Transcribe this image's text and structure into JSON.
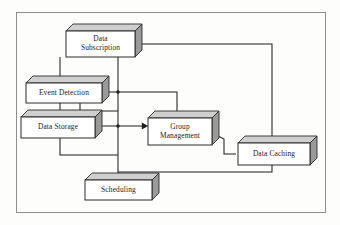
{
  "diagram": {
    "frame": {
      "x": 16,
      "y": 12,
      "width": 309,
      "height": 200,
      "border_color": "#8d8d8d",
      "background_color": "#fdfdfc"
    },
    "style": {
      "node_face_color": "#ffffff",
      "node_side_color": "#9a9a9a",
      "node_top_color": "#cfcfcf",
      "node_border_color": "#2b2b2b",
      "connector_color": "#1f1f1f",
      "text_color": "#1a1a1a"
    },
    "nodes": [
      {
        "id": "data-subscription",
        "label": "Data Subscription",
        "lines": [
          "Data",
          "Subscription"
        ],
        "x": 66,
        "y": 31,
        "width": 69,
        "height": 26,
        "depth": 7
      },
      {
        "id": "event-detection",
        "label": "Event Detection",
        "lines": [
          "Event Detection"
        ],
        "x": 26,
        "y": 83,
        "width": 76,
        "height": 20,
        "depth": 7
      },
      {
        "id": "data-storage",
        "label": "Data Storage",
        "lines": [
          "Data Storage"
        ],
        "x": 21,
        "y": 117,
        "width": 74,
        "height": 21,
        "depth": 7
      },
      {
        "id": "group-management",
        "label": "Group Management",
        "lines": [
          "Group",
          "Management"
        ],
        "x": 148,
        "y": 118,
        "width": 64,
        "height": 27,
        "depth": 7
      },
      {
        "id": "data-caching",
        "label": "Data Caching",
        "lines": [
          "Data Caching"
        ],
        "x": 238,
        "y": 143,
        "width": 72,
        "height": 22,
        "depth": 7
      },
      {
        "id": "scheduling",
        "label": "Scheduling",
        "lines": [
          "Scheduling"
        ],
        "x": 85,
        "y": 180,
        "width": 67,
        "height": 20,
        "depth": 7
      }
    ],
    "connections": [
      {
        "id": "subscription-to-event-detection",
        "from": "data-subscription",
        "to": "event-detection",
        "path": "M 60 57 L 60 76 L 60 81",
        "arrow": "down",
        "arrow_at": {
          "x": 60,
          "y": 82
        }
      },
      {
        "id": "subscription-to-scheduling-trunk",
        "from": "data-subscription",
        "to": "scheduling",
        "path": "M 118 57 L 118 178",
        "arrow": "down",
        "arrow_at": {
          "x": 118,
          "y": 179
        }
      },
      {
        "id": "subscription-to-data-caching",
        "from": "data-subscription",
        "to": "data-caching",
        "path": "M 142 44 L 272 44 L 272 141",
        "arrow": "down",
        "arrow_at": {
          "x": 272,
          "y": 142
        }
      },
      {
        "id": "event-detection-to-data-storage",
        "from": "event-detection",
        "to": "data-storage",
        "path": "M 60 103 L 60 115",
        "arrow": "down",
        "arrow_at": {
          "x": 60,
          "y": 116
        }
      },
      {
        "id": "event-detection-to-group-management",
        "from": "event-detection",
        "to": "group-management",
        "path": "M 109 92 L 177 92 L 177 116",
        "arrow": "down",
        "arrow_at": {
          "x": 177,
          "y": 117
        }
      },
      {
        "id": "data-storage-to-group-management",
        "from": "data-storage",
        "to": "group-management",
        "path": "M 102 126 L 146 126",
        "arrow": "right",
        "arrow_at": {
          "x": 147,
          "y": 126
        }
      },
      {
        "id": "event-detection-return-loop",
        "from": "event-detection",
        "to": "data-storage",
        "path": "M 80 103 L 80 111 L 118 111"
      },
      {
        "id": "data-storage-bottom-loop",
        "from": "data-storage",
        "to": "scheduling",
        "path": "M 60 138 L 60 155 L 118 155"
      },
      {
        "id": "group-management-to-data-caching",
        "from": "group-management",
        "to": "data-caching",
        "path": "M 212 133 L 224 139 L 224 154 L 236 154"
      },
      {
        "id": "data-caching-to-scheduling",
        "from": "data-caching",
        "to": "scheduling",
        "path": "M 272 165 L 272 172 L 118 172"
      }
    ],
    "junctions": [
      {
        "id": "junction-event-detection-row",
        "x": 118,
        "y": 92
      },
      {
        "id": "junction-data-storage-row",
        "x": 118,
        "y": 126
      }
    ]
  }
}
